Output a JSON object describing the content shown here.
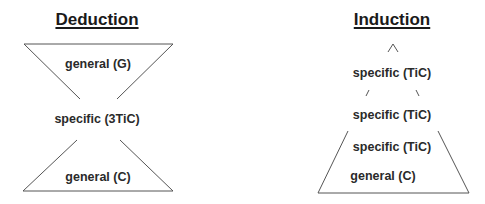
{
  "deduction": {
    "title": "Deduction",
    "top_label": "general (G)",
    "middle_label": "specific (3TiC)",
    "bottom_label": "general (C)"
  },
  "induction": {
    "title": "Induction",
    "apex_glyph": "^",
    "rows": [
      "specific (TiC)",
      "specific (TiC)",
      "specific (TiC)",
      "general (C)"
    ]
  },
  "colors": {
    "line": "#555555",
    "text": "#2a2a2a",
    "background": "#ffffff"
  }
}
